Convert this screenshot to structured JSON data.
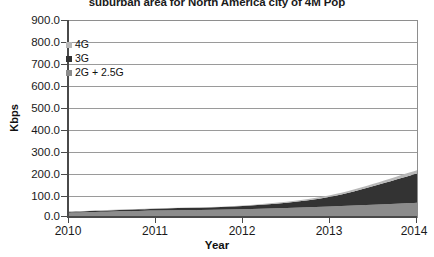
{
  "chart_data": {
    "type": "area",
    "stacked": true,
    "title": "suburban area for North America city of 4M Pop",
    "xlabel": "Year",
    "ylabel": "Kbps",
    "x": [
      2010,
      2011,
      2012,
      2013,
      2014
    ],
    "categories": [
      "2010",
      "2011",
      "2012",
      "2013",
      "2014"
    ],
    "xlim": [
      2010,
      2014
    ],
    "ylim": [
      0.0,
      900.0
    ],
    "ytick_labels": [
      "900.0",
      "800.0",
      "700.0",
      "600.0",
      "500.0",
      "400.0",
      "300.0",
      "200.0",
      "100.0",
      "0.0"
    ],
    "ytick_values": [
      900.0,
      800.0,
      700.0,
      600.0,
      500.0,
      400.0,
      300.0,
      200.0,
      100.0,
      0.0
    ],
    "ytick_step": 100.0,
    "grid": "horizontal",
    "legend_position": "upper-left-inside",
    "series": [
      {
        "name": "2G + 2.5G",
        "color": "#8c8c8c",
        "values": [
          20,
          30,
          36,
          48,
          65
        ]
      },
      {
        "name": "3G",
        "color": "#333333",
        "values": [
          4,
          8,
          14,
          45,
          135
        ]
      },
      {
        "name": "4G",
        "color": "#b8b8b8",
        "values": [
          1,
          2,
          3,
          7,
          15
        ]
      }
    ],
    "stack_totals": [
      25,
      40,
      53,
      100,
      215
    ],
    "colors": {
      "4g": "#b8b8b8",
      "3g": "#333333",
      "2g_25g": "#8c8c8c",
      "axis": "#4a4a4a",
      "grid": "#9a9a9a",
      "frame": "#8e8e8e",
      "text": "#1a1a1a",
      "background": "#ffffff"
    }
  },
  "legend": {
    "items": [
      {
        "label": "4G",
        "color": "#b8b8b8"
      },
      {
        "label": "3G",
        "color": "#333333"
      },
      {
        "label": "2G + 2.5G",
        "color": "#8c8c8c"
      }
    ]
  }
}
